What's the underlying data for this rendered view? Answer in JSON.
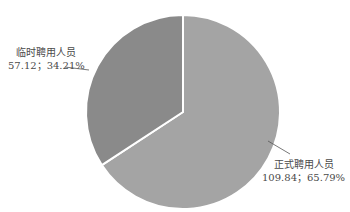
{
  "chart_data": {
    "type": "pie",
    "title": "",
    "categories": [
      "临时聘用人员",
      "正式聘用人员"
    ],
    "values": [
      57.12,
      109.84
    ],
    "percentages": [
      34.21,
      65.79
    ],
    "series": [
      {
        "name": "临时聘用人员",
        "value": 57.12,
        "percent": 34.21,
        "color": "#8a8a8a"
      },
      {
        "name": "正式聘用人员",
        "value": 109.84,
        "percent": 65.79,
        "color": "#a4a4a4"
      }
    ],
    "legend": "none",
    "start_angle_deg": 0,
    "direction": "clockwise"
  },
  "labels": {
    "temp": {
      "name": "临时聘用人员",
      "value": "57.12；34.21%"
    },
    "formal": {
      "name": "正式聘用人员",
      "value": "109.84；65.79%"
    }
  }
}
